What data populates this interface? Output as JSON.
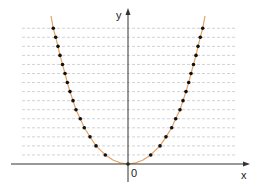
{
  "chart_data": {
    "type": "line",
    "title": "",
    "xlabel": "x",
    "ylabel": "y",
    "origin_label": "0",
    "function": "y = x^2 (parabola with marked points)",
    "grid": {
      "horizontal_dashed_lines": 15,
      "vertical": false
    },
    "series": [
      {
        "name": "parabola",
        "color": "#e8a060",
        "points_right_dx_px": [
          22.7,
          32,
          38,
          43.7,
          47.7,
          52,
          55,
          58,
          60.7,
          63,
          65.5,
          68,
          70,
          72.3,
          74.7
        ],
        "marker_levels": [
          1,
          2,
          3,
          4,
          5,
          6,
          7,
          8,
          9,
          10,
          11,
          12,
          13,
          14,
          15
        ],
        "includes_origin_point": true
      }
    ],
    "layout": {
      "origin_px": [
        128,
        164
      ],
      "line_spacing_px": 9.05,
      "grid_x_range_px": [
        22,
        236
      ],
      "x_axis_px": [
        11,
        250
      ],
      "y_axis_top_px": 8
    }
  },
  "labels": {
    "x": "x",
    "y": "y",
    "origin": "0"
  },
  "colors": {
    "curve": "#e8a060",
    "dots": "#111111",
    "grid": "#c8c8c8",
    "axis": "#333333"
  }
}
